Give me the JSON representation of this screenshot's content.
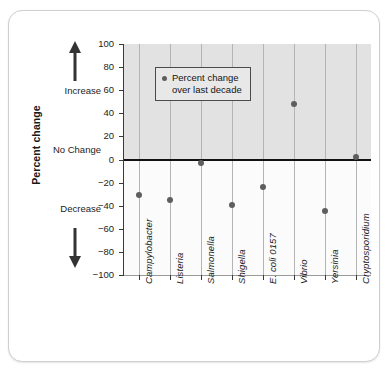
{
  "chart_data": {
    "type": "scatter",
    "title": "",
    "xlabel": "",
    "ylabel": "Percent change",
    "ylim": [
      -100,
      100
    ],
    "ytick_values": [
      100,
      80,
      60,
      40,
      20,
      0,
      -20,
      -40,
      -60,
      -80,
      -100
    ],
    "ytick_labels": [
      "100",
      "80",
      "60",
      "40",
      "20",
      "0",
      "−20",
      "−40",
      "−60",
      "−80",
      "−100"
    ],
    "grid": "vertical gridlines at each category",
    "legend_position": "upper-left inside plot",
    "categories": [
      "Campylobacter",
      "Listeria",
      "Salmonella",
      "Shigella",
      "E. coli 0157",
      "Vibrio",
      "Yersinia",
      "Cryptosporidium"
    ],
    "series": [
      {
        "name": "Percent change over last decade",
        "values": [
          -31,
          -35,
          -3,
          -39,
          -24,
          48,
          -45,
          2
        ]
      }
    ],
    "zero_reference_line": 0,
    "shaded_region": "positive values (0 to 100) shaded gray"
  },
  "axis": {
    "y_title": "Percent change",
    "increase_label": "Increase",
    "no_change_label": "No Change",
    "decrease_label": "Decrease",
    "up_arrow_icon": "arrow-up-icon",
    "down_arrow_icon": "arrow-down-icon"
  },
  "legend": {
    "marker_icon": "dot-marker-icon",
    "line_1": "Percent change",
    "line_2": "over last decade"
  },
  "colors": {
    "marker": "#5e5e5e",
    "zero_line": "#111111",
    "shade": "#e2e2e2",
    "plot_background": "#fbfbfb",
    "gridline": "#b4b4b4",
    "card_border": "#cfcfcf"
  }
}
